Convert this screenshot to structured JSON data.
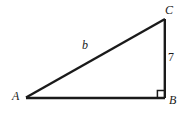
{
  "figure": {
    "kind": "right-triangle-diagram",
    "background_color": "#ffffff",
    "stroke_color": "#1a1a1a",
    "canvas": {
      "width": 187,
      "height": 117
    },
    "vertices": {
      "a": {
        "label": "A",
        "x": 26,
        "y": 98
      },
      "b": {
        "label": "B",
        "x": 165,
        "y": 98
      },
      "c": {
        "label": "C",
        "x": 165,
        "y": 19
      }
    },
    "sides": {
      "hypotenuse": {
        "label": "b",
        "from": "A",
        "to": "C"
      },
      "vertical": {
        "label": "7",
        "from": "B",
        "to": "C"
      },
      "base": {
        "label": "",
        "from": "A",
        "to": "B"
      }
    },
    "right_angle": {
      "at_vertex": "B",
      "marker": "square",
      "size": 7
    }
  }
}
